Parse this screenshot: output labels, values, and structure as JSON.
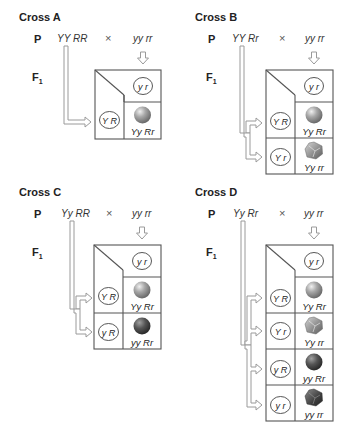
{
  "crosses": [
    {
      "id": "A",
      "title": "Cross A",
      "p_label": "P",
      "f1_label": "F",
      "f1_sub": "1",
      "parent1": "YY RR",
      "times": "×",
      "parent2": "yy rr",
      "parent2_gametes": [
        "y r"
      ],
      "parent1_gametes": [
        "Y R"
      ],
      "offspring": [
        {
          "genotype": "Yy Rr",
          "phenotype": "yellow-round"
        }
      ]
    },
    {
      "id": "B",
      "title": "Cross B",
      "p_label": "P",
      "f1_label": "F",
      "f1_sub": "1",
      "parent1": "YY Rr",
      "times": "×",
      "parent2": "yy rr",
      "parent2_gametes": [
        "y r"
      ],
      "parent1_gametes": [
        "Y R",
        "Y r"
      ],
      "offspring": [
        {
          "genotype": "Yy Rr",
          "phenotype": "yellow-round"
        },
        {
          "genotype": "Yy rr",
          "phenotype": "yellow-wrinkled"
        }
      ]
    },
    {
      "id": "C",
      "title": "Cross C",
      "p_label": "P",
      "f1_label": "F",
      "f1_sub": "1",
      "parent1": "Yy RR",
      "times": "×",
      "parent2": "yy rr",
      "parent2_gametes": [
        "y r"
      ],
      "parent1_gametes": [
        "Y R",
        "y R"
      ],
      "offspring": [
        {
          "genotype": "Yy Rr",
          "phenotype": "yellow-round"
        },
        {
          "genotype": "yy Rr",
          "phenotype": "green-round"
        }
      ]
    },
    {
      "id": "D",
      "title": "Cross D",
      "p_label": "P",
      "f1_label": "F",
      "f1_sub": "1",
      "parent1": "Yy Rr",
      "times": "×",
      "parent2": "yy rr",
      "parent2_gametes": [
        "y r"
      ],
      "parent1_gametes": [
        "Y R",
        "Y r",
        "y R",
        "y r"
      ],
      "offspring": [
        {
          "genotype": "Yy Rr",
          "phenotype": "yellow-round"
        },
        {
          "genotype": "Yy rr",
          "phenotype": "yellow-wrinkled"
        },
        {
          "genotype": "yy Rr",
          "phenotype": "green-round"
        },
        {
          "genotype": "yy rr",
          "phenotype": "green-wrinkled"
        }
      ]
    }
  ],
  "colors": {
    "grid_line": "#555555",
    "arrow_stroke": "#9a9a9a",
    "yellow_pea_light": "#d8d8d8",
    "yellow_pea_dark": "#7a7a7a",
    "green_pea_light": "#9a9a9a",
    "green_pea_dark": "#3a3a3a"
  }
}
